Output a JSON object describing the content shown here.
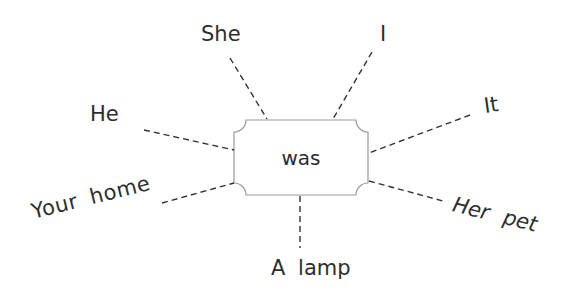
{
  "diagram": {
    "type": "word-web",
    "center": {
      "label": "was"
    },
    "spokes": [
      {
        "id": "she",
        "label": "She"
      },
      {
        "id": "i",
        "label": "I"
      },
      {
        "id": "he",
        "label": "He"
      },
      {
        "id": "it",
        "label": "It"
      },
      {
        "id": "your-home",
        "label": "Your home"
      },
      {
        "id": "her-pet",
        "label": "Her pet"
      },
      {
        "id": "a-lamp",
        "label": "A lamp"
      }
    ],
    "colors": {
      "line": "#333333",
      "box_border": "#9a9a9a",
      "text": "#2e2e2e",
      "background": "#ffffff"
    }
  }
}
